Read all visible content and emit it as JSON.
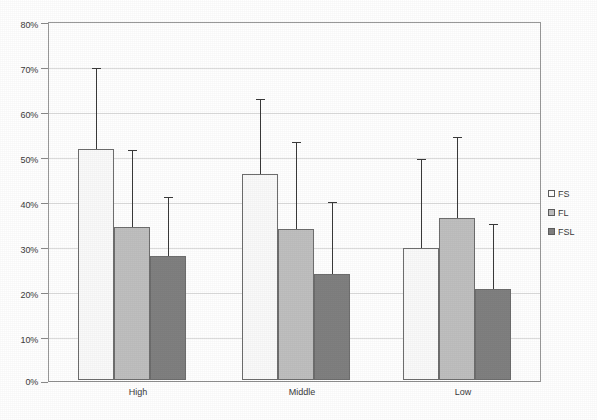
{
  "chart_data": {
    "type": "bar",
    "title": "",
    "subtitle": "",
    "xlabel": "",
    "ylabel": "",
    "categories": [
      "High",
      "Middle",
      "Low"
    ],
    "series": [
      {
        "name": "FS",
        "color": "#fafafa",
        "values": [
          52,
          46.5,
          29.7
        ],
        "error_upper": [
          70,
          63,
          49.5
        ]
      },
      {
        "name": "FL",
        "color": "#bfbfbf",
        "values": [
          34.5,
          34,
          36.5
        ],
        "error_upper": [
          51.5,
          53.5,
          54.5
        ]
      },
      {
        "name": "FSL",
        "color": "#808080",
        "values": [
          28,
          24,
          20.5
        ],
        "error_upper": [
          41,
          40,
          35
        ]
      }
    ],
    "ylim": [
      0,
      80
    ],
    "ytick_step": 10,
    "ytick_labels": [
      "0%",
      "10%",
      "20%",
      "30%",
      "40%",
      "50%",
      "60%",
      "70%",
      "80%"
    ],
    "ytick_values": [
      0,
      10,
      20,
      30,
      40,
      50,
      60,
      70,
      80
    ],
    "grid": true,
    "grid_axis": "y",
    "legend_position": "right",
    "error_bar_style": "upper-only-with-cap"
  },
  "axis": {
    "y_labels": [
      "80%",
      "70%",
      "60%",
      "50%",
      "40%",
      "30%",
      "20%",
      "10%",
      "0%"
    ],
    "x_labels": [
      "High",
      "Middle",
      "Low"
    ]
  },
  "legend": {
    "items": [
      {
        "label": "FS",
        "swatch": "fs"
      },
      {
        "label": "FL",
        "swatch": "fl"
      },
      {
        "label": "FSL",
        "swatch": "fsl"
      }
    ]
  },
  "colors": {
    "series_fs": "#fafafa",
    "series_fl": "#bfbfbf",
    "series_fsl": "#808080",
    "gridline": "#dcdcdc",
    "axis": "#8a8a8a",
    "bar_outline": "#6e6e6e",
    "error_bar": "#3a3a3a",
    "text": "#3b3b3b",
    "background": "#ffffff"
  }
}
